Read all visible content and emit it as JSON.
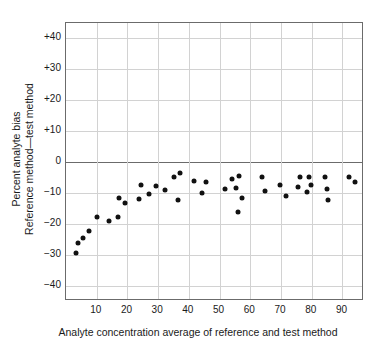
{
  "chart_data": {
    "type": "scatter",
    "title": "",
    "xlabel": "Analyte concentration average of reference and test method",
    "ylabel_line1": "Percent analyte bias",
    "ylabel_line2": "Reference method—test method",
    "xlim": [
      0,
      97
    ],
    "ylim": [
      -45,
      45
    ],
    "xticks": [
      10,
      20,
      30,
      40,
      50,
      60,
      70,
      80,
      90
    ],
    "xticklabels": [
      "10",
      "20",
      "30",
      "40",
      "50",
      "60",
      "70",
      "80",
      "90"
    ],
    "yticks": [
      40,
      30,
      20,
      10,
      0,
      -10,
      -20,
      -30,
      -40
    ],
    "yticklabels": [
      "+40",
      "+30",
      "+20",
      "+10",
      "0",
      "−10",
      "−20",
      "−30",
      "−40"
    ],
    "grid": true,
    "zero_line": true,
    "legend": null,
    "marker": "filled-circle",
    "marker_color": "#111111",
    "grid_color": "#d2d2d2",
    "axis_color": "#6b6b6b",
    "points": [
      {
        "x": 3.4,
        "y": -29.4
      },
      {
        "x": 3.8,
        "y": -26.3
      },
      {
        "x": 5.6,
        "y": -24.7
      },
      {
        "x": 7.6,
        "y": -22.2
      },
      {
        "x": 10.2,
        "y": -17.7
      },
      {
        "x": 14.1,
        "y": -19.2
      },
      {
        "x": 16.8,
        "y": -17.7
      },
      {
        "x": 17.2,
        "y": -11.8
      },
      {
        "x": 19.2,
        "y": -13.4
      },
      {
        "x": 23.8,
        "y": -11.9
      },
      {
        "x": 24.3,
        "y": -7.6
      },
      {
        "x": 27.0,
        "y": -10.3
      },
      {
        "x": 29.2,
        "y": -7.8
      },
      {
        "x": 32.2,
        "y": -9.2
      },
      {
        "x": 35.0,
        "y": -4.8
      },
      {
        "x": 36.4,
        "y": -12.3
      },
      {
        "x": 37.2,
        "y": -3.4
      },
      {
        "x": 41.8,
        "y": -6.3
      },
      {
        "x": 44.4,
        "y": -9.9
      },
      {
        "x": 45.5,
        "y": -6.5
      },
      {
        "x": 51.8,
        "y": -8.7
      },
      {
        "x": 54.0,
        "y": -5.4
      },
      {
        "x": 55.4,
        "y": -8.5
      },
      {
        "x": 56.3,
        "y": -4.4
      },
      {
        "x": 56.0,
        "y": -16.2
      },
      {
        "x": 57.3,
        "y": -11.6
      },
      {
        "x": 63.8,
        "y": -4.9
      },
      {
        "x": 64.8,
        "y": -9.4
      },
      {
        "x": 69.7,
        "y": -7.6
      },
      {
        "x": 71.6,
        "y": -11.1
      },
      {
        "x": 75.5,
        "y": -8.0
      },
      {
        "x": 76.2,
        "y": -4.8
      },
      {
        "x": 78.3,
        "y": -9.7
      },
      {
        "x": 79.2,
        "y": -5.0
      },
      {
        "x": 79.6,
        "y": -7.4
      },
      {
        "x": 84.4,
        "y": -4.7
      },
      {
        "x": 84.8,
        "y": -8.6
      },
      {
        "x": 85.3,
        "y": -12.2
      },
      {
        "x": 92.2,
        "y": -5.0
      },
      {
        "x": 94.2,
        "y": -6.5
      }
    ]
  }
}
